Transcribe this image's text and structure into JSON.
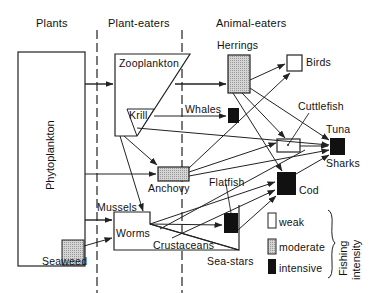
{
  "columns": {
    "plants": "Plants",
    "plant_eaters": "Plant-eaters",
    "animal_eaters": "Animal-eaters"
  },
  "organisms": {
    "phytoplankton": "Phytoplankton",
    "seaweed": "Seaweed",
    "zooplankton": "Zooplankton",
    "krill": "Krill",
    "whales": "Whales",
    "herrings": "Herrings",
    "birds": "Birds",
    "cuttlefish": "Cuttlefish",
    "tuna": "Tuna",
    "sharks": "Sharks",
    "anchovy": "Anchovy",
    "flatfish": "Flatfish",
    "cod": "Cod",
    "mussels": "Mussels",
    "worms": "Worms",
    "crustaceans": "Crustaceans",
    "sea_stars": "Sea-stars"
  },
  "legend": {
    "title_line1": "Fishing",
    "title_line2": "intensity",
    "items": [
      {
        "label": "weak",
        "fill": "#ffffff"
      },
      {
        "label": "moderate",
        "fill": "#c8c8c8"
      },
      {
        "label": "intensive",
        "fill": "#111111"
      }
    ]
  },
  "colors": {
    "weak": "#ffffff",
    "moderate": "#c8c8c8",
    "intensive": "#111111",
    "line": "#222222"
  }
}
